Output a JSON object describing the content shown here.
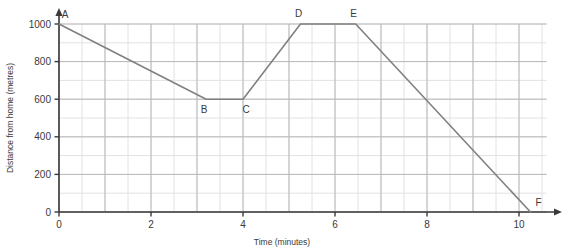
{
  "chart_data": {
    "type": "line",
    "title": "",
    "xlabel": "Time (minutes)",
    "ylabel": "Distance from home (metres)",
    "xlim": [
      0,
      10.9
    ],
    "ylim": [
      0,
      1060
    ],
    "xticks": [
      0,
      2,
      4,
      6,
      8,
      10
    ],
    "xtick_labels": [
      "0",
      "2",
      "4",
      "6",
      "8",
      "10"
    ],
    "yticks": [
      0,
      200,
      400,
      600,
      800,
      1000
    ],
    "ytick_labels": [
      "0",
      "200",
      "400",
      "600",
      "800",
      "1000"
    ],
    "grid": true,
    "grid_major_x_step": 1,
    "grid_minor_x_step": 0.5,
    "grid_major_y_step": 200,
    "grid_minor_y_step": 100,
    "legend": null,
    "line_color": "#808080",
    "grid_major_color": "#b9b9bd",
    "grid_minor_color": "#e2e2e6",
    "axis_color": "#3a3a3a",
    "series": [
      {
        "name": "journey",
        "points": [
          {
            "label": "A",
            "x": 0,
            "y": 1000
          },
          {
            "label": "B",
            "x": 3.2,
            "y": 600
          },
          {
            "label": "C",
            "x": 4.0,
            "y": 600
          },
          {
            "label": "D",
            "x": 5.25,
            "y": 1000
          },
          {
            "label": "E",
            "x": 6.45,
            "y": 1000
          },
          {
            "label": "F",
            "x": 10.25,
            "y": 0
          }
        ]
      }
    ],
    "annotations": [
      {
        "text": "A",
        "x": 0,
        "y": 1000,
        "dx": 6,
        "dy": -6
      },
      {
        "text": "B",
        "x": 3.2,
        "y": 600,
        "dx": -2,
        "dy": 14
      },
      {
        "text": "C",
        "x": 4.0,
        "y": 600,
        "dx": 3,
        "dy": 14
      },
      {
        "text": "D",
        "x": 5.25,
        "y": 1000,
        "dx": -2,
        "dy": -7
      },
      {
        "text": "E",
        "x": 6.45,
        "y": 1000,
        "dx": -2,
        "dy": -7
      },
      {
        "text": "F",
        "x": 10.25,
        "y": 0,
        "dx": 8,
        "dy": -6
      }
    ]
  }
}
